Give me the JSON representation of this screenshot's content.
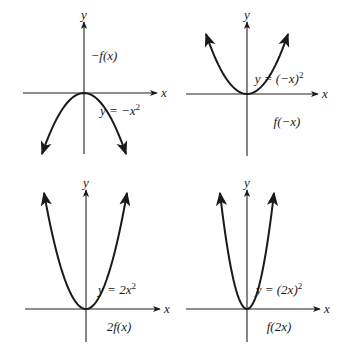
{
  "panels": [
    {
      "id": "neg-f",
      "transform_label": "−f(x)",
      "equation_prefix": "y = −x",
      "equation_exponent": "2",
      "x_axis_label": "x",
      "y_axis_label": "y",
      "origin": [
        84,
        93
      ],
      "x_range_px": [
        23,
        157
      ],
      "y_range_px": [
        22,
        154
      ],
      "curve": {
        "direction": "down",
        "left_end": [
          42,
          154
        ],
        "right_end": [
          126,
          154
        ]
      },
      "transform_label_pos": [
        104,
        60
      ],
      "equation_pos": [
        120,
        115
      ]
    },
    {
      "id": "f-neg-x",
      "transform_label": "f(−x)",
      "equation_prefix": "y = (−x)",
      "equation_exponent": "2",
      "x_axis_label": "x",
      "y_axis_label": "y",
      "origin": [
        247,
        94
      ],
      "x_range_px": [
        186,
        318
      ],
      "y_range_px": [
        22,
        156
      ],
      "curve": {
        "direction": "up",
        "left_end": [
          206,
          34
        ],
        "right_end": [
          288,
          34
        ]
      },
      "transform_label_pos": [
        287,
        126
      ],
      "equation_pos": [
        279,
        83
      ]
    },
    {
      "id": "two-f",
      "transform_label": "2f(x)",
      "equation_prefix": "y = 2x",
      "equation_exponent": "2",
      "x_axis_label": "x",
      "y_axis_label": "y",
      "origin": [
        86,
        309
      ],
      "x_range_px": [
        25,
        160
      ],
      "y_range_px": [
        190,
        342
      ],
      "curve": {
        "direction": "up",
        "left_end": [
          44,
          193
        ],
        "right_end": [
          127,
          193
        ]
      },
      "transform_label_pos": [
        119,
        331
      ],
      "equation_pos": [
        117,
        294
      ]
    },
    {
      "id": "f-two-x",
      "transform_label": "f(2x)",
      "equation_prefix": "y = (2x)",
      "equation_exponent": "2",
      "x_axis_label": "x",
      "y_axis_label": "y",
      "origin": [
        247,
        309
      ],
      "x_range_px": [
        186,
        320
      ],
      "y_range_px": [
        190,
        342
      ],
      "curve": {
        "direction": "up",
        "left_end": [
          220,
          193
        ],
        "right_end": [
          274,
          193
        ]
      },
      "transform_label_pos": [
        279,
        331
      ],
      "equation_pos": [
        279,
        294
      ]
    }
  ],
  "colors": {
    "stroke": "#1a1a1a",
    "axis": "#222222",
    "background": "#ffffff"
  }
}
